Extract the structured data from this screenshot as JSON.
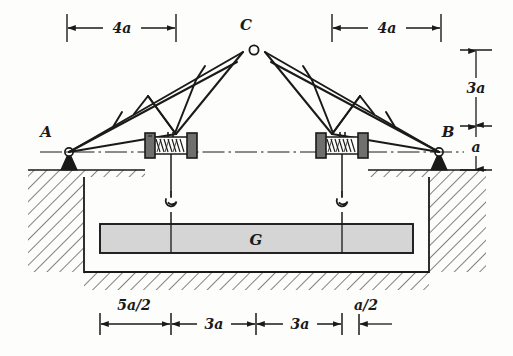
{
  "figure": {
    "type": "engineering-diagram",
    "background_color": "#fdfdfb",
    "line_color": "#1a1a1a"
  },
  "points": {
    "left_support": "A",
    "right_support": "B",
    "apex": "C"
  },
  "load": {
    "label": "G",
    "fill_color": "#d5d5d5"
  },
  "dimensions": {
    "top": [
      {
        "label": "4a",
        "side": "left"
      },
      {
        "label": "4a",
        "side": "right"
      }
    ],
    "vertical": [
      {
        "label": "3a",
        "position": "upper"
      },
      {
        "label": "a",
        "position": "lower"
      }
    ],
    "bottom": [
      {
        "label": "5a/2"
      },
      {
        "label": "3a"
      },
      {
        "label": "3a"
      },
      {
        "label": "a/2"
      }
    ]
  },
  "components": {
    "winch_left": "cable-drum-winch",
    "winch_right": "cable-drum-winch",
    "hook_left": "lifting-hook",
    "hook_right": "lifting-hook",
    "support_a_type": "pin-support",
    "support_b_type": "pin-support",
    "ground": "hatched-earth-pit"
  }
}
